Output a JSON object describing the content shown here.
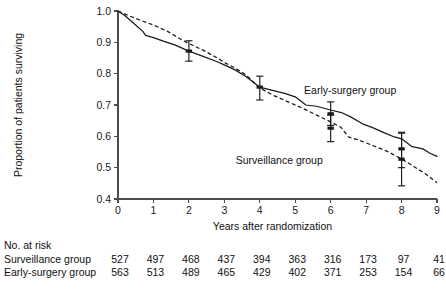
{
  "chart_data": {
    "type": "line",
    "title": "",
    "xlabel": "Years after randomization",
    "ylabel": "Proportion of patients surviving",
    "xlim": [
      0,
      9
    ],
    "ylim": [
      0.4,
      1.0
    ],
    "xticks": [
      "0",
      "1",
      "2",
      "3",
      "4",
      "5",
      "6",
      "7",
      "8",
      "9"
    ],
    "yticks": [
      "0.4",
      "0.5",
      "0.6",
      "0.7",
      "0.8",
      "0.9",
      "1.0"
    ],
    "grid": false,
    "legend_position": "inline-annotations",
    "series": [
      {
        "name": "Early-surgery group",
        "style": "solid",
        "label_x": 6.55,
        "label_y": 0.735,
        "points": [
          [
            0.0,
            1.0
          ],
          [
            0.2,
            0.985
          ],
          [
            0.45,
            0.96
          ],
          [
            0.7,
            0.935
          ],
          [
            0.78,
            0.922
          ],
          [
            1.0,
            0.915
          ],
          [
            1.3,
            0.903
          ],
          [
            1.6,
            0.892
          ],
          [
            2.0,
            0.872
          ],
          [
            2.4,
            0.855
          ],
          [
            2.8,
            0.838
          ],
          [
            3.0,
            0.828
          ],
          [
            3.3,
            0.812
          ],
          [
            3.6,
            0.792
          ],
          [
            4.0,
            0.757
          ],
          [
            4.3,
            0.748
          ],
          [
            4.7,
            0.737
          ],
          [
            5.0,
            0.726
          ],
          [
            5.3,
            0.7
          ],
          [
            5.6,
            0.696
          ],
          [
            6.0,
            0.684
          ],
          [
            6.3,
            0.676
          ],
          [
            6.55,
            0.663
          ],
          [
            6.9,
            0.64
          ],
          [
            7.2,
            0.627
          ],
          [
            7.5,
            0.612
          ],
          [
            7.8,
            0.598
          ],
          [
            8.0,
            0.592
          ],
          [
            8.3,
            0.567
          ],
          [
            8.6,
            0.56
          ],
          [
            8.8,
            0.546
          ],
          [
            9.0,
            0.536
          ]
        ]
      },
      {
        "name": "Surveillance group",
        "style": "dashed",
        "label_x": 4.55,
        "label_y": 0.512,
        "points": [
          [
            0.0,
            1.0
          ],
          [
            0.3,
            0.985
          ],
          [
            0.6,
            0.972
          ],
          [
            1.0,
            0.955
          ],
          [
            1.4,
            0.935
          ],
          [
            1.8,
            0.908
          ],
          [
            2.0,
            0.896
          ],
          [
            2.4,
            0.875
          ],
          [
            2.8,
            0.85
          ],
          [
            3.0,
            0.836
          ],
          [
            3.3,
            0.818
          ],
          [
            3.6,
            0.797
          ],
          [
            4.0,
            0.754
          ],
          [
            4.4,
            0.73
          ],
          [
            4.8,
            0.71
          ],
          [
            5.2,
            0.69
          ],
          [
            5.6,
            0.668
          ],
          [
            6.0,
            0.646
          ],
          [
            6.3,
            0.628
          ],
          [
            6.5,
            0.598
          ],
          [
            6.8,
            0.588
          ],
          [
            7.2,
            0.57
          ],
          [
            7.6,
            0.552
          ],
          [
            8.0,
            0.528
          ],
          [
            8.4,
            0.5
          ],
          [
            8.7,
            0.478
          ],
          [
            9.0,
            0.452
          ]
        ]
      }
    ],
    "error_bars": [
      {
        "series": "Early-surgery group",
        "x": 2,
        "y": 0.872,
        "low": 0.84,
        "high": 0.905
      },
      {
        "series": "Early-surgery group",
        "x": 4,
        "y": 0.757,
        "low": 0.716,
        "high": 0.792
      },
      {
        "series": "Early-surgery group",
        "x": 6,
        "y": 0.672,
        "low": 0.635,
        "high": 0.71
      },
      {
        "series": "Early-surgery group",
        "x": 8,
        "y": 0.56,
        "low": 0.5,
        "high": 0.613
      },
      {
        "series": "Surveillance group",
        "x": 6,
        "y": 0.626,
        "low": 0.583,
        "high": 0.668
      },
      {
        "series": "Surveillance group",
        "x": 8,
        "y": 0.527,
        "low": 0.442,
        "high": 0.61
      }
    ]
  },
  "risk_table": {
    "header": "No. at risk",
    "x_positions": [
      0,
      1,
      2,
      3,
      4,
      5,
      6,
      7,
      8,
      9
    ],
    "rows": [
      {
        "label": "Surveillance group",
        "values": [
          "527",
          "497",
          "468",
          "437",
          "394",
          "363",
          "316",
          "173",
          "97",
          "41"
        ]
      },
      {
        "label": "Early-surgery group",
        "values": [
          "563",
          "513",
          "489",
          "465",
          "429",
          "402",
          "371",
          "253",
          "154",
          "66"
        ]
      }
    ]
  }
}
